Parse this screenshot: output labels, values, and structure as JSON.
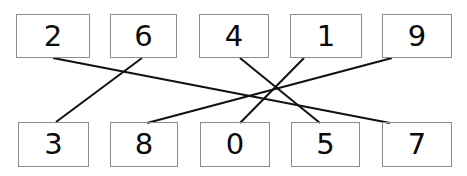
{
  "diagram": {
    "type": "matching-diagram",
    "canvas": {
      "width": 467,
      "height": 176,
      "background": "#ffffff"
    },
    "style": {
      "box_border_color": "#8c8c8c",
      "box_border_width": 1,
      "line_color": "#111111",
      "line_width": 2,
      "text_color": "#0a0a0a"
    },
    "top_row": {
      "name": "top-row",
      "nodes": [
        {
          "label": "2",
          "x": 16,
          "y": 14,
          "w": 74,
          "h": 44
        },
        {
          "label": "6",
          "x": 110,
          "y": 14,
          "w": 67,
          "h": 44
        },
        {
          "label": "4",
          "x": 199,
          "y": 14,
          "w": 70,
          "h": 44
        },
        {
          "label": "1",
          "x": 290,
          "y": 14,
          "w": 72,
          "h": 44
        },
        {
          "label": "9",
          "x": 382,
          "y": 14,
          "w": 70,
          "h": 44
        }
      ]
    },
    "bottom_row": {
      "name": "bottom-row",
      "nodes": [
        {
          "label": "3",
          "x": 18,
          "y": 122,
          "w": 71,
          "h": 45
        },
        {
          "label": "8",
          "x": 110,
          "y": 122,
          "w": 68,
          "h": 45
        },
        {
          "label": "0",
          "x": 200,
          "y": 122,
          "w": 70,
          "h": 45
        },
        {
          "label": "5",
          "x": 291,
          "y": 122,
          "w": 69,
          "h": 45
        },
        {
          "label": "7",
          "x": 382,
          "y": 122,
          "w": 70,
          "h": 45
        }
      ]
    },
    "connections": [
      {
        "from": "2",
        "to": "7",
        "x1": 53,
        "y1": 58,
        "x2": 390,
        "y2": 123
      },
      {
        "from": "6",
        "to": "3",
        "x1": 142,
        "y1": 58,
        "x2": 56,
        "y2": 122
      },
      {
        "from": "4",
        "to": "5",
        "x1": 240,
        "y1": 58,
        "x2": 320,
        "y2": 123
      },
      {
        "from": "1",
        "to": "0",
        "x1": 304,
        "y1": 58,
        "x2": 240,
        "y2": 123
      },
      {
        "from": "9",
        "to": "8",
        "x1": 392,
        "y1": 58,
        "x2": 147,
        "y2": 123
      }
    ]
  }
}
